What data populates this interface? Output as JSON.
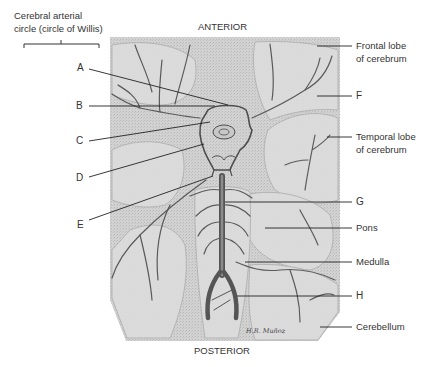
{
  "diagram": {
    "title_top": "ANTERIOR",
    "title_bottom": "POSTERIOR",
    "bracket_label_line1": "Cerebral arterial",
    "bracket_label_line2": "circle (circle of Willis)",
    "signature": "H.R. Muñoz",
    "left_labels": [
      "A",
      "B",
      "C",
      "D",
      "E"
    ],
    "right_labels": [
      {
        "id": "frontal",
        "line1": "Frontal lobe",
        "line2": "of cerebrum"
      },
      {
        "id": "F",
        "line1": "F"
      },
      {
        "id": "temporal",
        "line1": "Temporal lobe",
        "line2": "of cerebrum"
      },
      {
        "id": "G",
        "line1": "G"
      },
      {
        "id": "pons",
        "line1": "Pons"
      },
      {
        "id": "medulla",
        "line1": "Medulla"
      },
      {
        "id": "H",
        "line1": "H"
      },
      {
        "id": "cerebellum",
        "line1": "Cerebellum"
      }
    ],
    "colors": {
      "background": "#ffffff",
      "illustration_fill": "#cfcfcf",
      "vessel": "#5a5a5a",
      "leader_line": "#222222",
      "text": "#333333"
    }
  }
}
